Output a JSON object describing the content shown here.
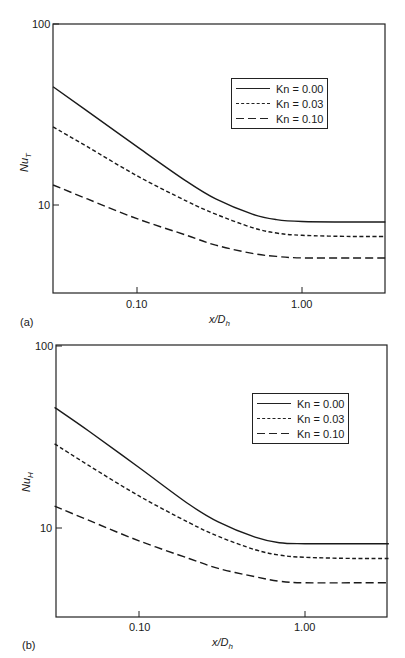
{
  "chart_data": [
    {
      "type": "line",
      "panel": "(a)",
      "xlabel": "x/D_h",
      "xlabel_main": "x/D",
      "xlabel_sub": "h",
      "ylabel": "Nu_T",
      "ylabel_main": "Nu",
      "ylabel_sub": "T",
      "xscale": "log",
      "yscale": "log",
      "xlim": [
        0.031,
        3.2
      ],
      "ylim": [
        3.2,
        100
      ],
      "xticks": [
        0.1,
        1.0
      ],
      "xtick_labels": [
        "0.10",
        "1.00"
      ],
      "yticks": [
        10,
        100
      ],
      "ytick_labels": [
        "10",
        "100"
      ],
      "grid": false,
      "legend_position": "upper right",
      "series": [
        {
          "name": "Kn = 0.00",
          "style": "solid",
          "x": [
            0.031,
            0.05,
            0.1,
            0.2,
            0.3,
            0.5,
            0.7,
            1.0,
            2.0,
            3.2
          ],
          "y": [
            45,
            33,
            21,
            13.5,
            10.8,
            8.9,
            8.3,
            8.1,
            8.05,
            8.05
          ]
        },
        {
          "name": "Kn = 0.03",
          "style": "short-dash",
          "x": [
            0.031,
            0.05,
            0.1,
            0.2,
            0.3,
            0.5,
            0.7,
            1.0,
            2.0,
            3.2
          ],
          "y": [
            27,
            21,
            14.5,
            10.5,
            8.9,
            7.5,
            7.0,
            6.8,
            6.7,
            6.7
          ]
        },
        {
          "name": "Kn = 0.10",
          "style": "long-dash",
          "x": [
            0.031,
            0.05,
            0.1,
            0.2,
            0.3,
            0.5,
            0.7,
            1.0,
            2.0,
            3.2
          ],
          "y": [
            12.9,
            10.8,
            8.4,
            6.8,
            6.0,
            5.4,
            5.2,
            5.1,
            5.1,
            5.1
          ]
        }
      ]
    },
    {
      "type": "line",
      "panel": "(b)",
      "xlabel": "x/D_h",
      "xlabel_main": "x/D",
      "xlabel_sub": "h",
      "ylabel": "Nu_H",
      "ylabel_main": "Nu",
      "ylabel_sub": "H",
      "xscale": "log",
      "yscale": "log",
      "xlim": [
        0.031,
        3.2
      ],
      "ylim": [
        3.2,
        100
      ],
      "xticks": [
        0.1,
        1.0
      ],
      "xtick_labels": [
        "0.10",
        "1.00"
      ],
      "yticks": [
        10,
        100
      ],
      "ytick_labels": [
        "10",
        "100"
      ],
      "grid": false,
      "legend_position": "upper right",
      "series": [
        {
          "name": "Kn = 0.00",
          "style": "solid",
          "x": [
            0.031,
            0.05,
            0.1,
            0.2,
            0.3,
            0.5,
            0.7,
            1.0,
            2.0,
            3.2
          ],
          "y": [
            46,
            34,
            21.5,
            13.5,
            10.8,
            8.9,
            8.3,
            8.2,
            8.2,
            8.2
          ]
        },
        {
          "name": "Kn = 0.03",
          "style": "short-dash",
          "x": [
            0.031,
            0.05,
            0.1,
            0.2,
            0.3,
            0.5,
            0.7,
            1.0,
            2.0,
            3.2
          ],
          "y": [
            29,
            22,
            15,
            10.7,
            9.0,
            7.6,
            7.1,
            6.9,
            6.8,
            6.8
          ]
        },
        {
          "name": "Kn = 0.10",
          "style": "long-dash",
          "x": [
            0.031,
            0.05,
            0.1,
            0.2,
            0.3,
            0.5,
            0.7,
            1.0,
            2.0,
            3.2
          ],
          "y": [
            13.2,
            11,
            8.5,
            6.8,
            6.0,
            5.4,
            5.1,
            5.0,
            5.0,
            5.0
          ]
        }
      ]
    }
  ],
  "panels": [
    {
      "label": "(a)"
    },
    {
      "label": "(b)"
    }
  ]
}
